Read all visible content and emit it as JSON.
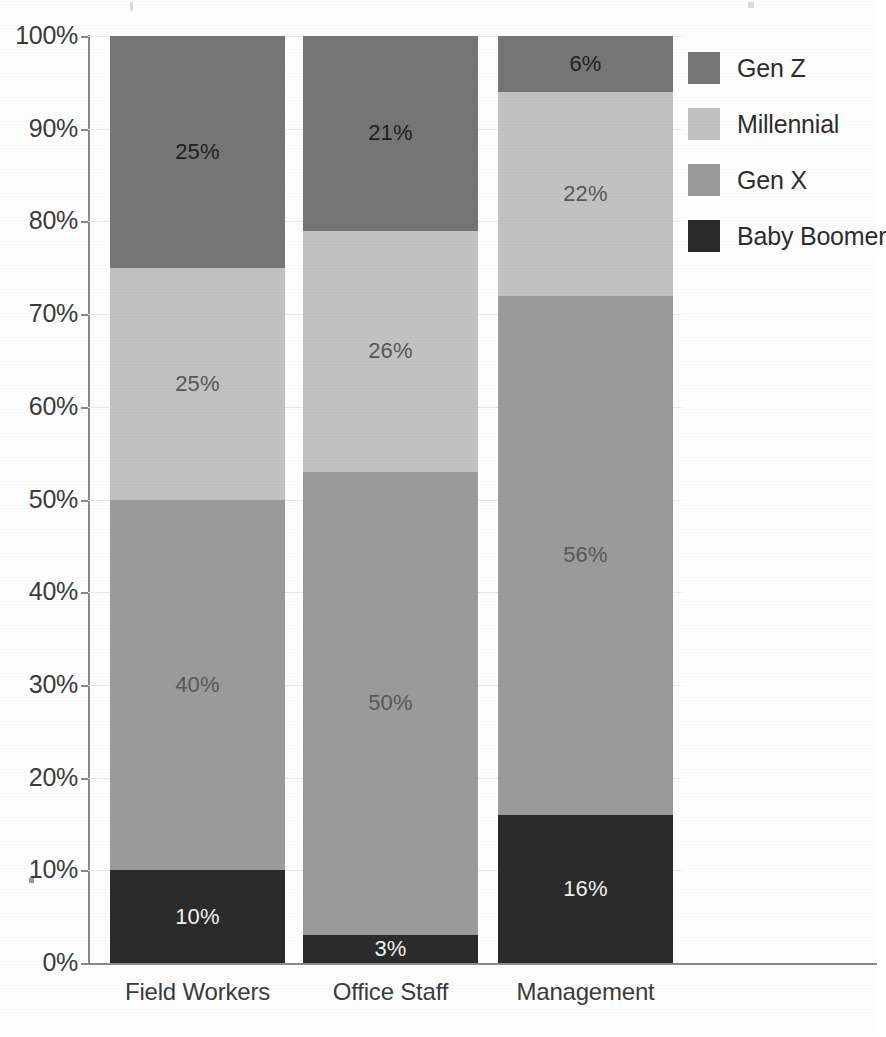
{
  "chart_data": {
    "type": "bar",
    "variant": "stacked-100",
    "title": "",
    "subtitle": "",
    "xlabel": "",
    "ylabel": "",
    "categories": [
      "Field Workers",
      "Office Staff",
      "Management"
    ],
    "ylim": [
      0,
      100
    ],
    "y_ticks": [
      0,
      10,
      20,
      30,
      40,
      50,
      60,
      70,
      80,
      90,
      100
    ],
    "y_tick_labels": [
      "0%",
      "10%",
      "20%",
      "30%",
      "40%",
      "50%",
      "60%",
      "70%",
      "80%",
      "90%",
      "100%"
    ],
    "grid": true,
    "legend_position": "right",
    "stack_order_top_to_bottom": [
      "Gen Z",
      "Millennial",
      "Gen X",
      "Baby Boomer"
    ],
    "series": [
      {
        "name": "Gen Z",
        "color": "#767676",
        "values": [
          25,
          21,
          6
        ],
        "labels": [
          "25%",
          "21%",
          "6%"
        ]
      },
      {
        "name": "Millennial",
        "color": "#c2c2c2",
        "values": [
          25,
          26,
          22
        ],
        "labels": [
          "25%",
          "26%",
          "22%"
        ]
      },
      {
        "name": "Gen X",
        "color": "#9b9b9b",
        "values": [
          40,
          50,
          56
        ],
        "labels": [
          "40%",
          "50%",
          "56%"
        ]
      },
      {
        "name": "Baby Boomer",
        "color": "#2b2b2b",
        "values": [
          10,
          3,
          16
        ],
        "labels": [
          "10%",
          "3%",
          "16%"
        ]
      }
    ]
  },
  "legend": {
    "items": [
      {
        "label": "Gen Z",
        "color": "#767676"
      },
      {
        "label": "Millennial",
        "color": "#c2c2c2"
      },
      {
        "label": "Gen X",
        "color": "#9b9b9b"
      },
      {
        "label": "Baby Boomer",
        "color": "#2b2b2b"
      }
    ]
  },
  "axis": {
    "y_labels": [
      "100%",
      "90%",
      "80%",
      "70%",
      "60%",
      "50%",
      "40%",
      "30%",
      "20%",
      "10%",
      "0%"
    ],
    "x_labels": [
      "Field Workers",
      "Office Staff",
      "Management"
    ]
  },
  "colors": {
    "gen_z": "#767676",
    "millennial": "#c2c2c2",
    "gen_x": "#9b9b9b",
    "baby_boomer": "#2b2b2b",
    "grid": "#e9e9e9",
    "axis": "#8a8a8a",
    "text": "#3b3b3b",
    "background": "#ffffff"
  }
}
